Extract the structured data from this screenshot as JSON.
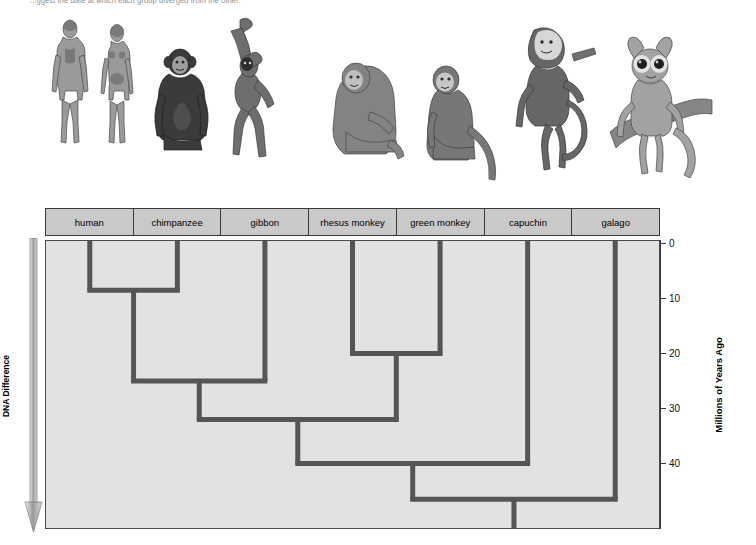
{
  "caption": "...ggest the date at which each group diverged from the other.",
  "labels": {
    "row": [
      "human",
      "chimpanzee",
      "gibbon",
      "rhesus monkey",
      "green monkey",
      "capuchin",
      "galago"
    ]
  },
  "left_axis": {
    "title": "DNA Difference",
    "direction": "down-arrow"
  },
  "right_axis": {
    "title": "Millions of Years Ago",
    "ticks": [
      "0",
      "10",
      "20",
      "30",
      "40"
    ]
  },
  "illustrations": [
    {
      "name": "human-male",
      "label": "human male"
    },
    {
      "name": "human-female",
      "label": "human female"
    },
    {
      "name": "chimpanzee",
      "label": "chimpanzee"
    },
    {
      "name": "gibbon",
      "label": "gibbon"
    },
    {
      "name": "rhesus-monkey",
      "label": "rhesus monkey"
    },
    {
      "name": "green-monkey",
      "label": "green monkey"
    },
    {
      "name": "capuchin",
      "label": "capuchin"
    },
    {
      "name": "galago",
      "label": "galago"
    }
  ],
  "chart_data": {
    "type": "line",
    "subtype": "cladogram",
    "title": "",
    "xlabel": "",
    "ylabel": "Millions of Years Ago",
    "ylim": [
      0,
      52
    ],
    "yticks": [
      0,
      10,
      20,
      30,
      40
    ],
    "y_direction": "increasing-downward",
    "secondary_axis": {
      "label": "DNA Difference",
      "direction": "increasing-downward"
    },
    "taxa": [
      "human",
      "chimpanzee",
      "gibbon",
      "rhesus monkey",
      "green monkey",
      "capuchin",
      "galago"
    ],
    "nodes": [
      {
        "id": "n1",
        "name": "human-chimpanzee",
        "children": [
          "human",
          "chimpanzee"
        ],
        "divergence_mya": 8.5
      },
      {
        "id": "n2",
        "name": "hominoid",
        "children": [
          "n1",
          "gibbon"
        ],
        "divergence_mya": 25
      },
      {
        "id": "n3",
        "name": "cercopithecoid",
        "children": [
          "rhesus monkey",
          "green monkey"
        ],
        "divergence_mya": 20
      },
      {
        "id": "n4",
        "name": "catarrhine",
        "children": [
          "n2",
          "n3"
        ],
        "divergence_mya": 32
      },
      {
        "id": "n5",
        "name": "anthropoid",
        "children": [
          "n4",
          "capuchin"
        ],
        "divergence_mya": 40
      },
      {
        "id": "n6",
        "name": "primate-root",
        "children": [
          "n5",
          "galago"
        ],
        "divergence_mya": 46.5
      }
    ],
    "grid": false,
    "legend": "none"
  },
  "colors": {
    "panel_background": "#e2e2e2",
    "header_background": "#c9c9c9",
    "tree_line": "#555555",
    "border": "#3a3a3a"
  }
}
